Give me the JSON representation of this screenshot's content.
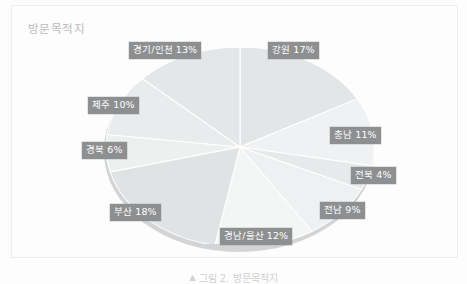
{
  "figure": {
    "title": "방문목적지",
    "caption_marker": "▲",
    "caption": "그림 2. 방문목적지",
    "background_color": "#fdfdfd",
    "label_box_color": "#8d8f91",
    "label_text_color": "#ffffff"
  },
  "chart_data": {
    "type": "pie",
    "title": "방문목적지",
    "xlabel": "",
    "ylabel": "",
    "legend_position": "none",
    "grid": false,
    "style": "3d-exploded-grayscale",
    "unit": "%",
    "categories": [
      "강원",
      "충남",
      "전북",
      "전남",
      "경남/울산",
      "부산",
      "경북",
      "제주",
      "경기/인천"
    ],
    "values": [
      17,
      11,
      4,
      9,
      12,
      18,
      6,
      10,
      13
    ],
    "labels": [
      "강원 17%",
      "충남 11%",
      "전북 4%",
      "전남 9%",
      "경남/울산 12%",
      "부산 18%",
      "경북 6%",
      "제주 10%",
      "경기/인천 13%"
    ],
    "slices": [
      {
        "name": "강원",
        "value": 17,
        "label": "강원 17%",
        "color": "#e3e5e7"
      },
      {
        "name": "충남",
        "value": 11,
        "label": "충남 11%",
        "color": "#f0f1f2"
      },
      {
        "name": "전북",
        "value": 4,
        "label": "전북 4%",
        "color": "#e7e9ea"
      },
      {
        "name": "전남",
        "value": 9,
        "label": "전남 9%",
        "color": "#eff0f1"
      },
      {
        "name": "경남/울산",
        "value": 12,
        "label": "경남/울산 12%",
        "color": "#f4f5f5"
      },
      {
        "name": "부산",
        "value": 18,
        "label": "부산 18%",
        "color": "#e0e2e4"
      },
      {
        "name": "경북",
        "value": 6,
        "label": "경북 6%",
        "color": "#eef0f0"
      },
      {
        "name": "제주",
        "value": 10,
        "label": "제주 10%",
        "color": "#e9ebec"
      },
      {
        "name": "경기/인천",
        "value": 13,
        "label": "경기/인천 13%",
        "color": "#e4e6e8"
      }
    ]
  }
}
